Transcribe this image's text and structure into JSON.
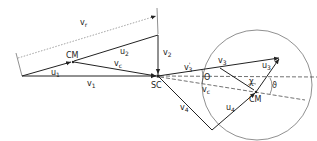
{
  "diagram": {
    "labels": {
      "v_r": "v",
      "v_r_sub": "r",
      "cm_left": "CM",
      "u1": "u",
      "u1_sub": "1",
      "u2": "u",
      "u2_sub": "2",
      "vc_left": "v",
      "vc_left_sub": "c",
      "v1": "v",
      "v1_sub": "1",
      "v2": "v",
      "v2_sub": "2",
      "sc": "SC",
      "v3_prime": "v",
      "v3_prime_sub": "3",
      "v3_prime_mark": "'",
      "theta": "Θ",
      "vc_right": "v",
      "vc_right_sub": "c",
      "v3": "v",
      "v3_sub": "3",
      "u3": "u",
      "u3_sub": "3",
      "phi": "ϑ",
      "chi": "χ",
      "cm_right": "CM",
      "u4": "u",
      "u4_sub": "4",
      "v4": "v",
      "v4_sub": "4"
    },
    "colors": {
      "stroke": "#222222",
      "background": "#ffffff"
    }
  }
}
